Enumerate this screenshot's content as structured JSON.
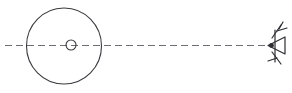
{
  "figure": {
    "background_color": "#ffffff",
    "width": 292,
    "height": 93,
    "alt_text": "A large circle with a small circle at its center sits at the left; a horizontal dashed line passes through both and extends to the right, ending at a hand-drawn eye symbol."
  },
  "colors": {
    "outline": "#3a3a3f",
    "axis": "#6e6e76",
    "eye": "#2e2e33",
    "background": "#ffffff"
  },
  "chart_data": {
    "type": "diagram",
    "title": "",
    "elements": [
      {
        "name": "large-circle",
        "role": "object",
        "shape": "circle",
        "center_x": 64,
        "center_y": 46,
        "radius": 37,
        "stroke": "#3a3a3f",
        "fill": "none"
      },
      {
        "name": "center-circle",
        "role": "object-center-marker",
        "shape": "circle",
        "center_x": 71,
        "center_y": 45,
        "radius": 5,
        "stroke": "#3a3a3f",
        "fill": "none"
      },
      {
        "name": "optical-axis",
        "role": "line-of-sight",
        "shape": "dashed-line",
        "x1": 5,
        "y1": 45,
        "x2": 267,
        "y2": 45,
        "dash": "7 4",
        "stroke": "#6e6e76"
      },
      {
        "name": "eye-symbol",
        "role": "observer",
        "shape": "eye",
        "apex_x": 268,
        "apex_y": 45,
        "width": 22,
        "height": 40,
        "stroke": "#2e2e33",
        "facing": "left"
      }
    ],
    "annotations": [],
    "legend": []
  }
}
